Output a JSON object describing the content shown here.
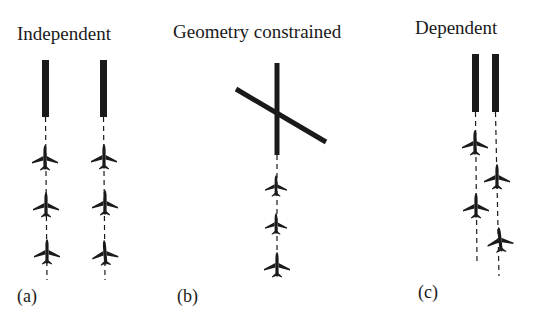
{
  "panels": [
    {
      "id": "a",
      "title": "Independent",
      "label": "(a)",
      "description": "Two parallel runways, each with its own independent stream of three aircraft on approach"
    },
    {
      "id": "b",
      "title": "Geometry constrained",
      "label": "(b)",
      "description": "Two intersecting runways; a single stream of three aircraft approaches the vertical runway"
    },
    {
      "id": "c",
      "title": "Dependent",
      "label": "(c)",
      "description": "Two closely spaced parallel runways with staggered aircraft approaches"
    }
  ],
  "icons": {
    "runway": "runway-bar",
    "aircraft": "airplane-icon",
    "approach_path": "dashed-line"
  },
  "colors": {
    "ink": "#1a1a1a",
    "background": "#ffffff"
  }
}
